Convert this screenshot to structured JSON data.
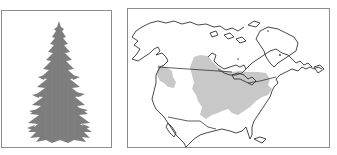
{
  "figure": {
    "left_panel": {
      "subject": "conifer-tree-silhouette",
      "fill_color": "#7d7d7d",
      "border_color": "#8c8c8c"
    },
    "right_panel": {
      "subject": "north-america-range-map",
      "outline_color": "#333333",
      "range_fill_color": "#c8c8c8",
      "border_color": "#8c8c8c"
    }
  }
}
